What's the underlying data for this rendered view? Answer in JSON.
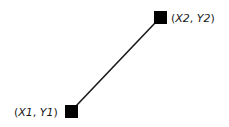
{
  "diagram": {
    "line_color": "#1a1a1a",
    "marker_color": "#000000",
    "points": [
      {
        "id": "p1",
        "label_x": "X1",
        "label_y": "Y1",
        "open": "(",
        "sep": ", ",
        "close": ")"
      },
      {
        "id": "p2",
        "label_x": "X2",
        "label_y": "Y2",
        "open": "(",
        "sep": ", ",
        "close": ")"
      }
    ]
  }
}
